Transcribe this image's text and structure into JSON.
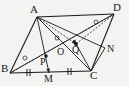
{
  "figure": {
    "type": "geometry-diagram",
    "shape": "parallelogram",
    "title": "",
    "stroke_color": "#1a1a1a",
    "background_color": "#f3f3f1",
    "dot_color": "#111111",
    "labels": [
      {
        "id": "A",
        "text": "A",
        "x": 30,
        "y": 5
      },
      {
        "id": "D",
        "text": "D",
        "x": 114,
        "y": 3
      },
      {
        "id": "B",
        "text": "B",
        "x": 1,
        "y": 64
      },
      {
        "id": "C",
        "text": "C",
        "x": 90,
        "y": 70
      },
      {
        "id": "M",
        "text": "M",
        "x": 44,
        "y": 74
      },
      {
        "id": "N",
        "text": "N",
        "x": 106,
        "y": 44
      },
      {
        "id": "P",
        "text": "P",
        "x": 40,
        "y": 58
      },
      {
        "id": "O",
        "text": "O",
        "x": 58,
        "y": 46
      },
      {
        "id": "Q",
        "text": "Q",
        "x": 72,
        "y": 46
      }
    ],
    "vertices": {
      "A": [
        37,
        17
      ],
      "D": [
        114,
        14
      ],
      "B": [
        10,
        73
      ],
      "C": [
        91,
        71
      ],
      "M": [
        49,
        73
      ],
      "N": [
        105,
        48
      ],
      "P": [
        46,
        56
      ],
      "O": [
        63,
        52
      ],
      "Q": [
        76,
        44
      ]
    },
    "solid_segments": [
      {
        "name": "side-AB",
        "from": "A",
        "to": "B"
      },
      {
        "name": "side-BC",
        "from": "B",
        "to": "C"
      },
      {
        "name": "side-CD",
        "from": "C",
        "to": "D"
      },
      {
        "name": "side-DA",
        "from": "D",
        "to": "A"
      },
      {
        "name": "diagonal-AC",
        "from": "A",
        "to": "C"
      },
      {
        "name": "diagonal-BD",
        "from": "B",
        "to": "D"
      },
      {
        "name": "cevian-AM",
        "from": "A",
        "to": "M"
      },
      {
        "name": "cevian-AN",
        "from": "A",
        "to": "N"
      },
      {
        "name": "segment-CN",
        "from": "C",
        "to": "N"
      }
    ],
    "dashed_segments": [
      {
        "name": "dashed-BQ-D",
        "from": "B",
        "to": "D"
      },
      {
        "name": "dashed-AQ",
        "from": "A",
        "to": "Q"
      }
    ],
    "marked_points": [
      {
        "name": "point-P",
        "at": "P"
      },
      {
        "name": "point-Q",
        "at": "Q"
      }
    ],
    "tick_marks": [
      {
        "name": "tick-BM",
        "on": "BM",
        "count": 2
      },
      {
        "name": "tick-MC",
        "on": "MC",
        "count": 2
      }
    ],
    "angle_markers": [
      {
        "name": "angle-marker-B",
        "x": 25,
        "y": 58
      },
      {
        "name": "angle-marker-center",
        "x": 57,
        "y": 38
      },
      {
        "name": "angle-marker-D",
        "x": 96,
        "y": 22
      }
    ],
    "arrow_heads": [
      {
        "name": "arrow-on-AQ"
      },
      {
        "name": "arrow-on-AM"
      },
      {
        "name": "arrow-on-CN"
      },
      {
        "name": "arrow-on-QC"
      }
    ]
  }
}
